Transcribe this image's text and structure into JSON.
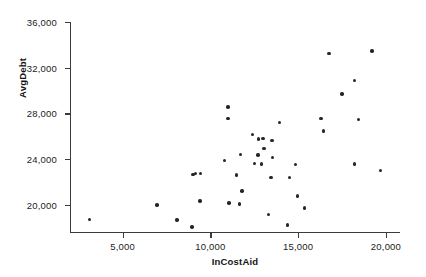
{
  "chart_data": {
    "type": "scatter",
    "title": "",
    "xlabel": "InCostAid",
    "ylabel": "AvgDebt",
    "xlim": [
      2000,
      20800
    ],
    "ylim": [
      17600,
      36000
    ],
    "grid": false,
    "legend": null,
    "x_ticks": [
      5000,
      10000,
      15000,
      20000
    ],
    "x_tick_labels": [
      "5,000",
      "10,000",
      "15,000",
      "20,000"
    ],
    "y_ticks": [
      20000,
      24000,
      28000,
      32000,
      36000
    ],
    "y_tick_labels": [
      "20,000",
      "24,000",
      "28,000",
      "32,000",
      "36,000"
    ],
    "marker": "filled-circle",
    "marker_color": "#262626",
    "point_count": 42,
    "points": [
      {
        "x": 3100,
        "y": 18700
      },
      {
        "x": 6950,
        "y": 19950
      },
      {
        "x": 8100,
        "y": 18650
      },
      {
        "x": 8950,
        "y": 18050
      },
      {
        "x": 9000,
        "y": 22650
      },
      {
        "x": 9150,
        "y": 22700
      },
      {
        "x": 9450,
        "y": 22700
      },
      {
        "x": 9400,
        "y": 20300
      },
      {
        "x": 10800,
        "y": 23850
      },
      {
        "x": 11000,
        "y": 28550
      },
      {
        "x": 11000,
        "y": 27550
      },
      {
        "x": 11050,
        "y": 20150
      },
      {
        "x": 11500,
        "y": 22600
      },
      {
        "x": 11700,
        "y": 24400
      },
      {
        "x": 11800,
        "y": 21200
      },
      {
        "x": 11650,
        "y": 20050
      },
      {
        "x": 12400,
        "y": 26150
      },
      {
        "x": 12700,
        "y": 24350
      },
      {
        "x": 12500,
        "y": 23600
      },
      {
        "x": 12750,
        "y": 25750
      },
      {
        "x": 13000,
        "y": 25800
      },
      {
        "x": 13050,
        "y": 24900
      },
      {
        "x": 12900,
        "y": 23550
      },
      {
        "x": 13500,
        "y": 25600
      },
      {
        "x": 13550,
        "y": 24150
      },
      {
        "x": 13450,
        "y": 22350
      },
      {
        "x": 13300,
        "y": 19150
      },
      {
        "x": 13950,
        "y": 27200
      },
      {
        "x": 14400,
        "y": 18200
      },
      {
        "x": 14500,
        "y": 22350
      },
      {
        "x": 14850,
        "y": 23500
      },
      {
        "x": 14950,
        "y": 20750
      },
      {
        "x": 15350,
        "y": 19700
      },
      {
        "x": 16300,
        "y": 27550
      },
      {
        "x": 16450,
        "y": 26450
      },
      {
        "x": 16750,
        "y": 33250
      },
      {
        "x": 17500,
        "y": 29700
      },
      {
        "x": 18200,
        "y": 30850
      },
      {
        "x": 18200,
        "y": 23550
      },
      {
        "x": 18450,
        "y": 27450
      },
      {
        "x": 19200,
        "y": 33450
      },
      {
        "x": 19700,
        "y": 23000
      }
    ]
  }
}
